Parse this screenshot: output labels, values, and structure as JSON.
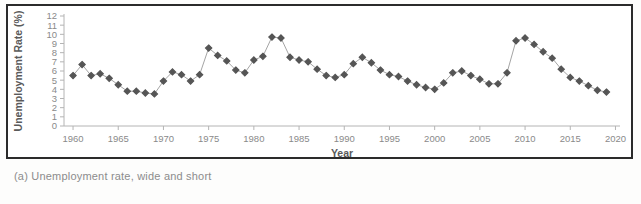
{
  "figure": {
    "caption": "(a) Unemployment rate, wide and short",
    "frame_color": "#2b2b2b",
    "background": "#ffffff"
  },
  "chart_data": {
    "type": "line",
    "title": "",
    "subtitle": "",
    "xlabel": "Year",
    "ylabel": "Unemployment Rate (%)",
    "xlim": [
      1959,
      2020.5
    ],
    "ylim": [
      0,
      12
    ],
    "xticks": [
      1960,
      1965,
      1970,
      1975,
      1980,
      1985,
      1990,
      1995,
      2000,
      2005,
      2010,
      2015,
      2020
    ],
    "xtick_labels": [
      "1960",
      "1965",
      "1970",
      "1975",
      "1980",
      "1985",
      "1990",
      "1995",
      "2000",
      "2005",
      "2010",
      "2015",
      "2020"
    ],
    "yticks": [
      0,
      1,
      2,
      3,
      4,
      5,
      6,
      7,
      8,
      9,
      10,
      11,
      12
    ],
    "ytick_labels": [
      "0",
      "1",
      "2",
      "3",
      "4",
      "5",
      "6",
      "7",
      "8",
      "9",
      "10",
      "11",
      "12"
    ],
    "grid": false,
    "legend": false,
    "legend_position": "none",
    "marker": "diamond",
    "marker_color": "#555555",
    "line_color": "#9a9a9a",
    "series": [
      {
        "name": "Unemployment Rate",
        "x": [
          1960,
          1961,
          1962,
          1963,
          1964,
          1965,
          1966,
          1967,
          1968,
          1969,
          1970,
          1971,
          1972,
          1973,
          1974,
          1975,
          1976,
          1977,
          1978,
          1979,
          1980,
          1981,
          1982,
          1983,
          1984,
          1985,
          1986,
          1987,
          1988,
          1989,
          1990,
          1991,
          1992,
          1993,
          1994,
          1995,
          1996,
          1997,
          1998,
          1999,
          2000,
          2001,
          2002,
          2003,
          2004,
          2005,
          2006,
          2007,
          2008,
          2009,
          2010,
          2011,
          2012,
          2013,
          2014,
          2015,
          2016,
          2017,
          2018,
          2019
        ],
        "values": [
          5.5,
          6.7,
          5.5,
          5.7,
          5.2,
          4.5,
          3.8,
          3.8,
          3.6,
          3.5,
          4.9,
          5.9,
          5.6,
          4.9,
          5.6,
          8.5,
          7.7,
          7.1,
          6.1,
          5.8,
          7.2,
          7.6,
          9.7,
          9.6,
          7.5,
          7.2,
          7.0,
          6.2,
          5.5,
          5.3,
          5.6,
          6.8,
          7.5,
          6.9,
          6.1,
          5.6,
          5.4,
          4.9,
          4.5,
          4.2,
          4.0,
          4.7,
          5.8,
          6.0,
          5.5,
          5.1,
          4.6,
          4.6,
          5.8,
          9.3,
          9.6,
          8.9,
          8.1,
          7.4,
          6.2,
          5.3,
          4.9,
          4.4,
          3.9,
          3.7
        ]
      }
    ]
  }
}
